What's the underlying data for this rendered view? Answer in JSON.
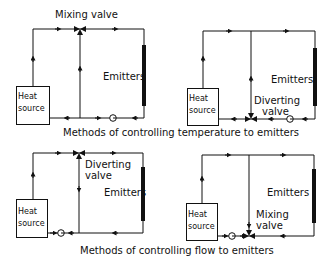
{
  "diagrams": [
    {
      "id": "temp-mixing",
      "valve_label": "Mixing valve",
      "emitters_label": "Emitters",
      "heat_source_line1": "Heat",
      "heat_source_line2": "source"
    },
    {
      "id": "temp-diverting",
      "valve_label_line1": "Diverting",
      "valve_label_line2": "valve",
      "emitters_label": "Emitters",
      "heat_source_line1": "Heat",
      "heat_source_line2": "source"
    },
    {
      "id": "flow-diverting",
      "valve_label_line1": "Diverting",
      "valve_label_line2": "valve",
      "emitters_label": "Emitters",
      "heat_source_line1": "Heat",
      "heat_source_line2": "source"
    },
    {
      "id": "flow-mixing",
      "valve_label_line1": "Mixing",
      "valve_label_line2": "valve",
      "emitters_label": "Emitters",
      "heat_source_line1": "Heat",
      "heat_source_line2": "source"
    }
  ],
  "captions": {
    "temperature": "Methods of controlling temperature to emitters",
    "flow": "Methods of controlling flow to emitters"
  },
  "colors": {
    "line": "#111111",
    "background": "#ffffff"
  }
}
